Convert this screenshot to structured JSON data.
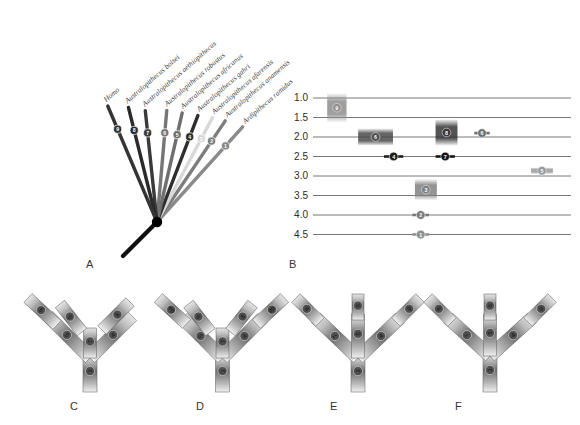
{
  "figure": {
    "panels": [
      {
        "id": "A",
        "letter": "A",
        "type": "star-phylogeny",
        "x": 86,
        "y": 262
      },
      {
        "id": "B",
        "letter": "B",
        "type": "temporal-range-chart",
        "x": 289,
        "y": 262
      },
      {
        "id": "C",
        "letter": "C",
        "type": "cladogram",
        "x": 70,
        "y": 407
      },
      {
        "id": "D",
        "letter": "D",
        "type": "cladogram",
        "x": 196,
        "y": 407
      },
      {
        "id": "E",
        "letter": "E",
        "type": "cladogram",
        "x": 330,
        "y": 407
      },
      {
        "id": "F",
        "letter": "F",
        "type": "cladogram",
        "x": 455,
        "y": 407
      }
    ]
  },
  "panelA": {
    "label": "A",
    "taxa": [
      {
        "num": "1",
        "name": "Ardipithecus ramidus",
        "color": "#8a8a8a",
        "angle": -48,
        "len": 128
      },
      {
        "num": "2",
        "name": "Australopithecus anamensis",
        "color": "#7d7d7d",
        "angle": -56,
        "len": 122
      },
      {
        "num": "3",
        "name": "Australopithecus afarensis",
        "color": "#d8d8d8",
        "angle": -62,
        "len": 118
      },
      {
        "num": "4",
        "name": "Australopithecus gahri",
        "color": "#2e2e2e",
        "angle": -69,
        "len": 114
      },
      {
        "num": "5",
        "name": "Australopithecus africanus",
        "color": "#6f6f6f",
        "angle": -77,
        "len": 112
      },
      {
        "num": "6",
        "name": "Australopithecus robustus",
        "color": "#767676",
        "angle": -85,
        "len": 112
      },
      {
        "num": "7",
        "name": "Australopithecus aethiopithecus",
        "color": "#3a3a3a",
        "angle": -96,
        "len": 112
      },
      {
        "num": "8",
        "name": "Australopithecus boisei",
        "color": "#2a2a2a",
        "angle": -104,
        "len": 118
      },
      {
        "num": "9",
        "name": "Homo",
        "color": "#343434",
        "angle": -113,
        "len": 126
      }
    ],
    "root_color": "#111111"
  },
  "panelB": {
    "label": "B",
    "y_axis": {
      "ticks": [
        "1.0",
        "1.5",
        "2.0",
        "2.5",
        "3.0",
        "3.5",
        "4.0",
        "4.5"
      ],
      "units": "Ma",
      "min": 1.0,
      "max": 4.5
    },
    "ranges": [
      {
        "num": "9",
        "top": 0.88,
        "bottom": 1.62,
        "x": 0.055,
        "width": 0.075,
        "color": "#8e8e8e",
        "style": "box"
      },
      {
        "num": "6",
        "top": 1.78,
        "bottom": 2.22,
        "x": 0.175,
        "width": 0.135,
        "color": "#4a4a4a",
        "style": "box"
      },
      {
        "num": "8",
        "top": 1.55,
        "bottom": 2.22,
        "x": 0.475,
        "width": 0.085,
        "color": "#353535",
        "style": "box"
      },
      {
        "num": "6b",
        "label": "6",
        "top": 1.87,
        "bottom": 1.93,
        "x": 0.625,
        "width": 0.06,
        "color": "#707070",
        "style": "bar"
      },
      {
        "num": "4",
        "top": 2.46,
        "bottom": 2.54,
        "x": 0.275,
        "width": 0.075,
        "color": "#1e1e1e",
        "style": "bar"
      },
      {
        "num": "7",
        "top": 2.46,
        "bottom": 2.54,
        "x": 0.475,
        "width": 0.075,
        "color": "#151515",
        "style": "bar"
      },
      {
        "num": "5",
        "top": 2.78,
        "bottom": 2.95,
        "x": 0.845,
        "width": 0.085,
        "color": "#9a9a9a",
        "style": "box"
      },
      {
        "num": "3",
        "top": 3.08,
        "bottom": 3.62,
        "x": 0.395,
        "width": 0.085,
        "color": "#808080",
        "style": "box"
      },
      {
        "num": "2",
        "top": 3.96,
        "bottom": 4.04,
        "x": 0.385,
        "width": 0.065,
        "color": "#7a7a7a",
        "style": "bar"
      },
      {
        "num": "1",
        "top": 4.46,
        "bottom": 4.54,
        "x": 0.385,
        "width": 0.065,
        "color": "#909090",
        "style": "bar"
      }
    ]
  },
  "panelC": {
    "label": "C",
    "branches": [
      {
        "num": "9",
        "pos": "upper-left-outer"
      },
      {
        "num": "6",
        "pos": "upper-left-inner"
      },
      {
        "num": "8",
        "pos": "upper-right-outer"
      },
      {
        "num": "5",
        "pos": "mid-left"
      },
      {
        "num": "7",
        "pos": "mid-center"
      },
      {
        "num": "4",
        "pos": "mid-right"
      },
      {
        "num": "3",
        "pos": "stem"
      }
    ]
  },
  "panelD": {
    "label": "D",
    "branches": [
      {
        "num": "9a",
        "pos": "upper-left-outer"
      },
      {
        "num": "6",
        "pos": "upper-left-inner"
      },
      {
        "num": "8",
        "pos": "upper-right-inner"
      },
      {
        "num": "9b",
        "pos": "upper-right-outer"
      },
      {
        "num": "5",
        "pos": "mid-left"
      },
      {
        "num": "7",
        "pos": "mid-center"
      },
      {
        "num": "4",
        "pos": "mid-right"
      },
      {
        "num": "3",
        "pos": "stem"
      }
    ]
  },
  "panelE": {
    "label": "E",
    "branches": [
      {
        "num": "8",
        "pos": "upper-left-outer"
      },
      {
        "num": "6",
        "pos": "upper-center"
      },
      {
        "num": "9",
        "pos": "upper-right-outer"
      },
      {
        "num": "7",
        "pos": "mid-left"
      },
      {
        "num": "5",
        "pos": "mid-center"
      },
      {
        "num": "4",
        "pos": "mid-right"
      },
      {
        "num": "3",
        "pos": "stem"
      }
    ]
  },
  "panelF": {
    "label": "F",
    "branches": [
      {
        "num": "8",
        "pos": "upper-left-outer"
      },
      {
        "num": "6",
        "pos": "upper-center"
      },
      {
        "num": "9",
        "pos": "upper-right-outer"
      },
      {
        "num": "7",
        "pos": "mid-left"
      },
      {
        "num": "5",
        "pos": "mid-center"
      },
      {
        "num": "4",
        "pos": "mid-right"
      },
      {
        "num": "3",
        "pos": "stem"
      }
    ]
  }
}
